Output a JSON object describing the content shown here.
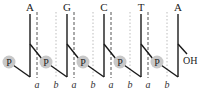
{
  "diagram": {
    "title": "",
    "nucleotides": [
      {
        "base": "A",
        "x": 30
      },
      {
        "base": "G",
        "x": 67
      },
      {
        "base": "C",
        "x": 104
      },
      {
        "base": "T",
        "x": 141
      },
      {
        "base": "A",
        "x": 178
      }
    ],
    "phosphate_label": "P",
    "phosphates_x": [
      9,
      46,
      83,
      120,
      157
    ],
    "terminal_group": "OH",
    "marker_labels": [
      {
        "text": "a",
        "x": 37
      },
      {
        "text": "b",
        "x": 56
      },
      {
        "text": "a",
        "x": 74
      },
      {
        "text": "b",
        "x": 93
      },
      {
        "text": "a",
        "x": 111
      },
      {
        "text": "b",
        "x": 130
      },
      {
        "text": "a",
        "x": 148
      },
      {
        "text": "b",
        "x": 167
      }
    ],
    "colors": {
      "line": "#1a1a1a",
      "phosphate_fill": "#c8c8c8",
      "dashed_a": "#555555",
      "dotted_b": "#bdbdbd"
    }
  }
}
